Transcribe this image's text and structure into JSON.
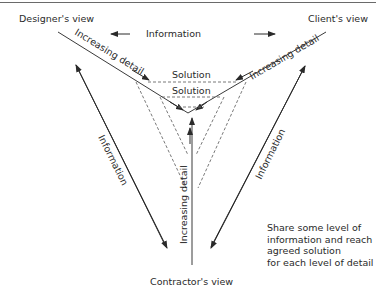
{
  "diagram": {
    "views": {
      "designer": "Designer's view",
      "client": "Client's view",
      "contractor": "Contractor's view"
    },
    "axis_labels": {
      "designer_axis": "Increasing detail",
      "client_axis": "Increasing detail",
      "contractor_axis": "Increasing detail"
    },
    "information_arrows": {
      "top": "Information",
      "left": "Information",
      "right": "Information"
    },
    "solutions": [
      "Solution",
      "Solution"
    ],
    "note": "Share some level of\ninformation and reach\nagreed solution\nfor each level of detail",
    "colors": {
      "line": "#3a3a3a",
      "dashed": "#6a6a6a",
      "text": "#2a2a2a"
    }
  }
}
